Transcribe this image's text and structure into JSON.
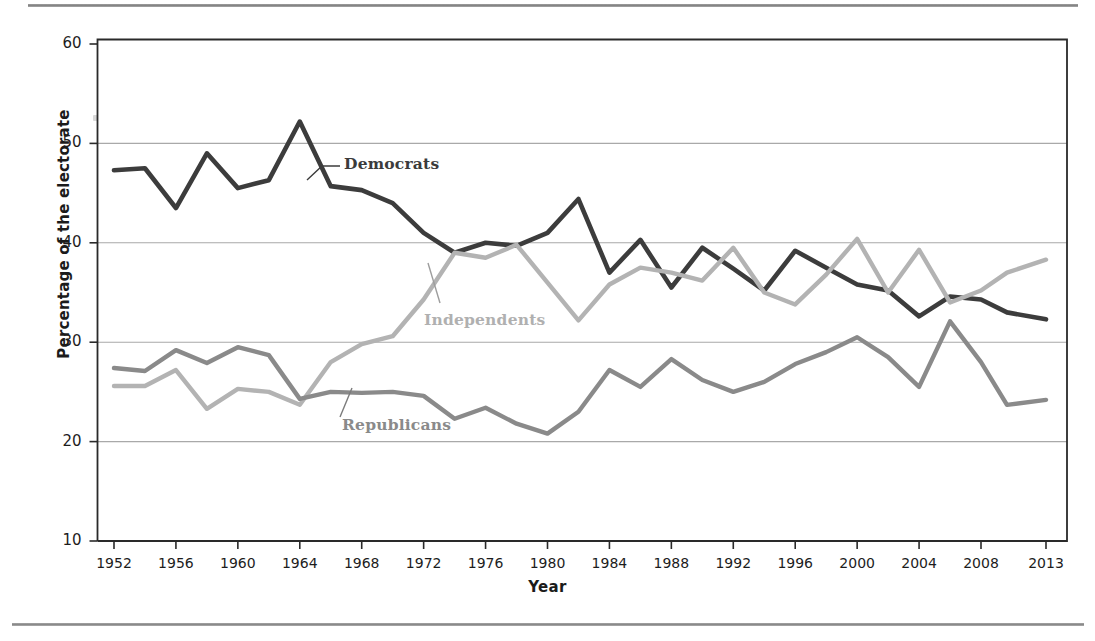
{
  "figure": {
    "ylabel": "Percentage of the electorate",
    "xlabel": "Year"
  },
  "chart_data": {
    "type": "line",
    "title": "",
    "xlabel": "Year",
    "ylabel": "Percentage of the electorate",
    "xlim": [
      1952,
      2013
    ],
    "ylim": [
      10,
      60
    ],
    "yticks": [
      10,
      20,
      30,
      40,
      50,
      60
    ],
    "xticks": [
      1952,
      1956,
      1960,
      1964,
      1968,
      1972,
      1976,
      1980,
      1984,
      1988,
      1992,
      1996,
      2000,
      2004,
      2008,
      2013
    ],
    "grid": "horizontal",
    "legend_position": "inline-annotations",
    "x": [
      1952,
      1954,
      1956,
      1958,
      1960,
      1962,
      1964,
      1966,
      1968,
      1970,
      1972,
      1974,
      1976,
      1978,
      1980,
      1982,
      1984,
      1986,
      1988,
      1990,
      1992,
      1994,
      1996,
      1998,
      2000,
      2002,
      2004,
      2006,
      2008,
      2010,
      2013
    ],
    "series": [
      {
        "name": "Democrats",
        "color": "#3c3c3c",
        "values": [
          47.3,
          47.5,
          43.5,
          49.0,
          45.5,
          46.3,
          52.2,
          45.7,
          45.3,
          44.0,
          41.0,
          39.0,
          40.0,
          39.7,
          41.0,
          44.4,
          37.0,
          40.3,
          35.5,
          39.5,
          37.4,
          35.2,
          39.2,
          37.5,
          35.8,
          35.2,
          32.6,
          34.6,
          34.3,
          33.0,
          32.3
        ]
      },
      {
        "name": "Independents",
        "color": "#b3b3b3",
        "values": [
          25.6,
          25.6,
          27.2,
          23.3,
          25.3,
          25.0,
          23.7,
          28.0,
          29.8,
          30.6,
          34.3,
          39.0,
          38.5,
          39.8,
          36.0,
          32.2,
          35.8,
          37.5,
          37.0,
          36.2,
          39.5,
          35.0,
          33.8,
          36.8,
          40.4,
          35.0,
          39.3,
          34.0,
          35.2,
          37.0,
          38.3
        ]
      },
      {
        "name": "Republicans",
        "color": "#8a8a8a",
        "values": [
          27.4,
          27.1,
          29.2,
          27.9,
          29.5,
          28.7,
          24.3,
          25.0,
          24.9,
          25.0,
          24.6,
          22.3,
          23.4,
          21.8,
          20.8,
          23.0,
          27.2,
          25.5,
          28.3,
          26.2,
          25.0,
          26.0,
          27.8,
          29.0,
          30.5,
          28.5,
          25.5,
          32.1,
          28.0,
          23.7,
          24.2
        ]
      }
    ],
    "annotations": [
      {
        "label": "Democrats",
        "series": "Democrats"
      },
      {
        "label": "Independents",
        "series": "Independents"
      },
      {
        "label": "Republicans",
        "series": "Republicans"
      }
    ]
  }
}
